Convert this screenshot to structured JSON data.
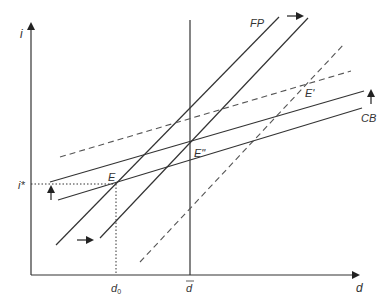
{
  "diagram": {
    "axes": {
      "y_label": "i",
      "x_label": "d"
    },
    "tick_labels": {
      "i_star": "i*",
      "d_zero": "d",
      "d_zero_sub": "0",
      "d_bar": "d"
    },
    "curve_labels": {
      "fp": "FP",
      "cb": "CB"
    },
    "points": {
      "e": "E",
      "e_prime": "E'",
      "e_double_prime": "E\""
    },
    "shift_arrows": [
      {
        "name": "fp-shift-right",
        "direction": "right"
      },
      {
        "name": "fp-lower-shift-right",
        "direction": "right"
      },
      {
        "name": "cb-shift-up",
        "direction": "up"
      },
      {
        "name": "cb-left-shift-up",
        "direction": "up"
      }
    ],
    "colors": {
      "line": "#333333",
      "dashed": "#555555"
    }
  }
}
